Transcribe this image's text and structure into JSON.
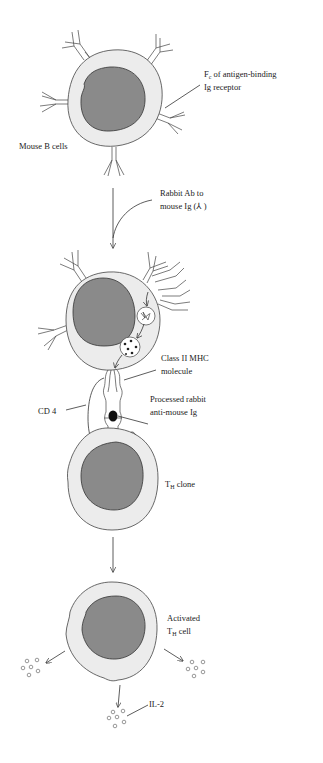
{
  "figure": {
    "colors": {
      "background": "#ffffff",
      "cytoplasm": "#ececec",
      "nucleus": "#8a8a8a",
      "outline": "#333333"
    }
  },
  "labels": {
    "fc_receptor_main": "F",
    "fc_receptor_sub": "c",
    "fc_receptor_rest": " of antigen-binding",
    "fc_receptor_line2": "Ig receptor",
    "mouse_b_cells": "Mouse B cells",
    "rabbit_ab_line1": "Rabbit Ab to",
    "rabbit_ab_line2": "mouse Ig (⅄ )",
    "class_ii_line1": "Class II MHC",
    "class_ii_line2": "molecule",
    "processed_line1": "Processed rabbit",
    "processed_line2": "anti-mouse Ig",
    "cd4": "CD 4",
    "th_clone_main": "T",
    "th_clone_sub": "H",
    "th_clone_rest": " clone",
    "activated_line1": "Activated",
    "activated_main": "T",
    "activated_sub": "H",
    "activated_rest": " cell",
    "il2": "IL-2"
  },
  "stages": [
    {
      "name": "Mouse B cell with Ig receptors"
    },
    {
      "name": "B cell internalizing and processing rabbit Ab"
    },
    {
      "name": "TH clone recognizing Class II MHC + peptide"
    },
    {
      "name": "Activated TH cell secreting IL-2"
    }
  ]
}
